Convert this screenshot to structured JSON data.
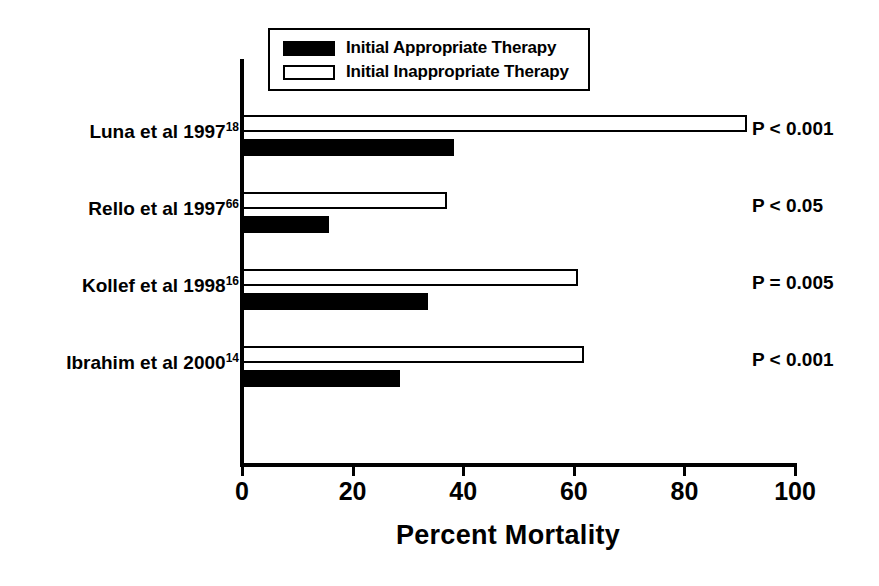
{
  "chart_data": {
    "type": "bar",
    "orientation": "horizontal",
    "title": "",
    "xlabel": "Percent Mortality",
    "ylabel": "",
    "xlim": [
      0,
      100
    ],
    "xticks": [
      0,
      20,
      40,
      60,
      80,
      100
    ],
    "grid": false,
    "legend_position": "top-left",
    "categories": [
      "Luna et al 1997",
      "Rello et al 1997",
      "Kollef et al 1998",
      "Ibrahim et al 2000"
    ],
    "category_refs": [
      "18",
      "66",
      "16",
      "14"
    ],
    "series": [
      {
        "name": "Initial Appropriate Therapy",
        "color": "#000000",
        "style": "filled",
        "values": [
          38.3,
          15.7,
          33.6,
          28.6
        ]
      },
      {
        "name": "Initial Inappropriate Therapy",
        "color": "#ffffff",
        "style": "hollow",
        "values": [
          91.3,
          37.1,
          60.8,
          61.9
        ]
      }
    ],
    "annotations": [
      "P < 0.001",
      "P < 0.05",
      "P = 0.005",
      "P < 0.001"
    ]
  },
  "legend": {
    "items": [
      {
        "label": "Initial Appropriate Therapy",
        "swatch": "filled-black-swatch"
      },
      {
        "label": "Initial Inappropriate Therapy",
        "swatch": "hollow-white-swatch"
      }
    ]
  },
  "axis": {
    "tick_labels": [
      "0",
      "20",
      "40",
      "60",
      "80",
      "100"
    ],
    "x_title": "Percent Mortality"
  },
  "rows": [
    {
      "label": "Luna et al 1997",
      "ref": "18",
      "inappropriate": 91.3,
      "appropriate": 38.3,
      "pvalue": "P < 0.001"
    },
    {
      "label": "Rello et al 1997",
      "ref": "66",
      "inappropriate": 37.1,
      "appropriate": 15.7,
      "pvalue": "P < 0.05"
    },
    {
      "label": "Kollef et al 1998",
      "ref": "16",
      "inappropriate": 60.8,
      "appropriate": 33.6,
      "pvalue": "P = 0.005"
    },
    {
      "label": "Ibrahim et al 2000",
      "ref": "14",
      "inappropriate": 61.9,
      "appropriate": 28.6,
      "pvalue": "P < 0.001"
    }
  ]
}
